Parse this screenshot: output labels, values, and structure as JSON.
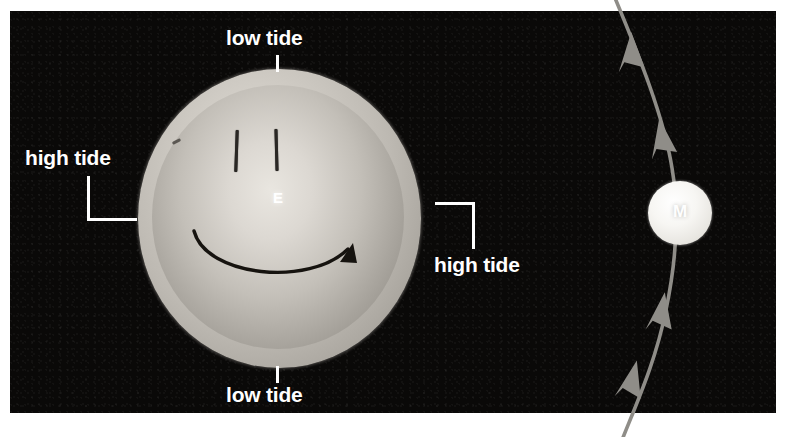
{
  "diagram": {
    "background_color": "#0a0908",
    "panel": {
      "left": 10,
      "top": 11,
      "width": 766,
      "height": 402
    },
    "label_color": "#ffffff"
  },
  "earth": {
    "symbol": "E",
    "name": "Earth",
    "center": {
      "x": 278,
      "y": 218
    },
    "tidal_bulge_color": "#c8c4bd",
    "solid_color": "#b0aca5",
    "rotation_arrow": "counterclockwise-rotation-arrow",
    "rotation_direction": "eastward"
  },
  "moon": {
    "symbol": "M",
    "name": "Moon",
    "center": {
      "x": 680,
      "y": 213
    },
    "radius": 32,
    "color": "#f4f2ef"
  },
  "orbit": {
    "name": "moon-orbit-path",
    "color": "#8f8d88",
    "arrow_count": 4,
    "arrow_direction": "upward"
  },
  "labels": {
    "low_tide_top": "low tide",
    "low_tide_bottom": "low tide",
    "high_tide_left": "high tide",
    "high_tide_right": "high tide"
  },
  "leaders": {
    "tick_top": "low-tide-top-tick",
    "tick_bottom": "low-tide-bottom-tick",
    "bracket_left": "high-tide-left-bracket",
    "bracket_right": "high-tide-right-bracket"
  }
}
